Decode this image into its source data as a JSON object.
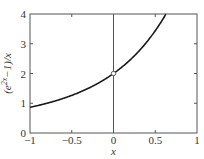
{
  "chart_data": {
    "type": "line",
    "title": "",
    "xlabel": "x",
    "ylabel": "(e^{2x}−1)/x",
    "xlim": [
      -1,
      1
    ],
    "ylim": [
      0,
      4
    ],
    "xticks": [
      -1,
      -0.5,
      0,
      0.5,
      1
    ],
    "xtick_labels": [
      "−1",
      "−0.5",
      "0",
      "0.5",
      "1"
    ],
    "yticks": [
      0,
      1,
      2,
      3,
      4
    ],
    "ytick_labels": [
      "0",
      "1",
      "2",
      "3",
      "4"
    ],
    "grid": false,
    "legend": null,
    "series": [
      {
        "name": "(e^{2x}−1)/x",
        "function": "(exp(2x)-1)/x",
        "x": [
          -1.0,
          -0.8,
          -0.6,
          -0.4,
          -0.2,
          0.0,
          0.2,
          0.4,
          0.5,
          0.6,
          0.63
        ],
        "values": [
          0.865,
          0.993,
          1.165,
          1.376,
          1.648,
          2.0,
          2.459,
          3.064,
          3.437,
          3.868,
          4.0
        ]
      }
    ],
    "annotations": [
      {
        "type": "vertical-line",
        "x": 0
      },
      {
        "type": "open-circle",
        "x": 0,
        "y": 2,
        "note": "removable discontinuity"
      }
    ]
  },
  "labels": {
    "x_axis": "x",
    "y_axis_prefix": "(e",
    "y_axis_sup": "2x",
    "y_axis_suffix": "−1)/x"
  },
  "colors": {
    "curve": "#1a1a1a",
    "axes": "#555555",
    "marker": "#444444"
  }
}
